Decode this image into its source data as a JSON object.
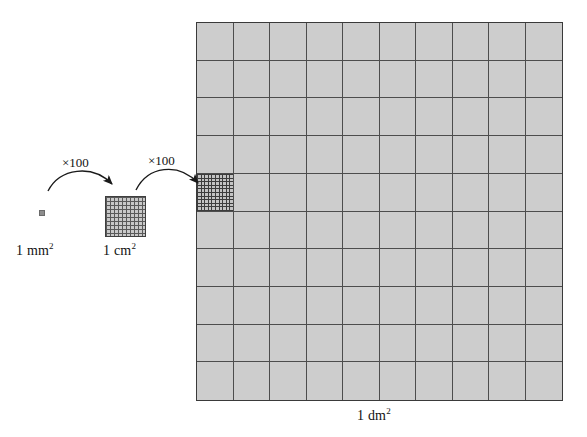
{
  "figure": {
    "title_visible": false,
    "background_color": "#ffffff",
    "fill_color": "#cdcdcd",
    "grid_line_color": "#4d4d4d",
    "outline_color": "#3a3a3a",
    "hatch_color": "#3d3d3d"
  },
  "units": {
    "mm": {
      "label_prefix": "1 mm",
      "label_exponent": "2",
      "full_label": "1 mm2"
    },
    "cm": {
      "label_prefix": "1 cm",
      "label_exponent": "2",
      "full_label": "1 cm2",
      "subdivisions": "10 x 10"
    },
    "dm": {
      "label_prefix": "1 dm",
      "label_exponent": "2",
      "full_label": "1 dm2",
      "subdivisions": "10 x 10"
    }
  },
  "arrows": [
    {
      "name": "mm-to-cm",
      "multiplier_label": "×100"
    },
    {
      "name": "cm-to-dm",
      "multiplier_label": "×100"
    }
  ],
  "grid": {
    "columns": 10,
    "rows": 10,
    "total_cells": 100,
    "highlighted_cell": {
      "column_index": 1,
      "row_index": 5
    }
  }
}
